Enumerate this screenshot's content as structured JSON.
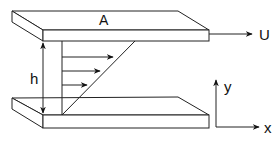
{
  "labels": {
    "top_plate": "A",
    "velocity": "U",
    "gap_height": "h",
    "y_axis": "y",
    "x_axis": "x"
  },
  "colors": {
    "stroke": "#222222",
    "background": "#ffffff"
  },
  "velocity_profile": {
    "type": "linear",
    "arrow_count": 3
  }
}
